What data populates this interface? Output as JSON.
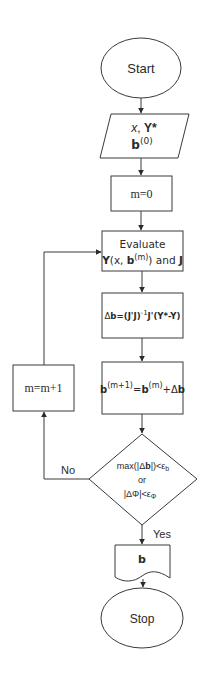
{
  "flowchart": {
    "nodes": {
      "start": {
        "shape": "ellipse",
        "label": "Start"
      },
      "input": {
        "shape": "parallelogram",
        "line1": {
          "x": "x",
          "sep": ", ",
          "Y": "Y*"
        },
        "line2": {
          "b": "b",
          "sup": "(0)"
        }
      },
      "init": {
        "shape": "rectangle",
        "label": "m=0"
      },
      "evaluate": {
        "shape": "rectangle",
        "line1": "Evaluate",
        "line2": {
          "Y": "Y",
          "open": "(x, ",
          "b": "b",
          "sup": "(m)",
          "close": ") and ",
          "J": "J"
        }
      },
      "delta": {
        "shape": "rectangle",
        "parts": {
          "delta": "Δ",
          "b": "b",
          "eq": "=(J'J)",
          "sup": "-1",
          "rest": "J'(Y*-Y)"
        }
      },
      "update": {
        "shape": "rectangle",
        "parts": {
          "b1": "b",
          "sup1": "(m+1)",
          "eq": "=",
          "b2": "b",
          "sup2": "(m)",
          "plus": "+Δ",
          "b3": "b"
        }
      },
      "decision": {
        "shape": "diamond",
        "line1": {
          "pre": "max(|Δ",
          "b": "b",
          "post": "|)<ε",
          "sub": "b"
        },
        "line2": "or",
        "line3": {
          "pre": "|ΔΦ|<ε",
          "sub": "Φ"
        }
      },
      "increment": {
        "shape": "rectangle",
        "label": "m=m+1"
      },
      "output": {
        "shape": "document",
        "label": "b"
      },
      "stop": {
        "shape": "ellipse",
        "label": "Stop"
      }
    },
    "edges": {
      "no_label": "No",
      "yes_label": "Yes"
    },
    "colors": {
      "stroke": "#3a3a3a",
      "text": "#2a2a2a",
      "background": "#ffffff"
    }
  }
}
